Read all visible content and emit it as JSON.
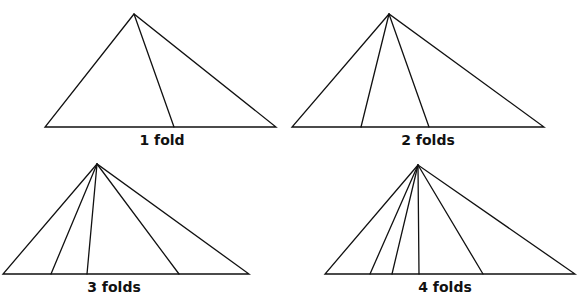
{
  "figure": {
    "panels": [
      {
        "label": "1 fold",
        "apex": [
          134,
          14
        ],
        "base_y": 127,
        "base_left": 45,
        "base_right": 276,
        "fold_xs": [
          174
        ],
        "label_pos": [
          162,
          132
        ]
      },
      {
        "label": "2 folds",
        "apex": [
          389,
          14
        ],
        "base_y": 127,
        "base_left": 292,
        "base_right": 544,
        "fold_xs": [
          361,
          429
        ],
        "label_pos": [
          428,
          132
        ]
      },
      {
        "label": "3 folds",
        "apex": [
          97,
          164
        ],
        "base_y": 274,
        "base_left": 3,
        "base_right": 249,
        "fold_xs": [
          51,
          87,
          179
        ],
        "label_pos": [
          114,
          279
        ]
      },
      {
        "label": "4 folds",
        "apex": [
          418,
          165
        ],
        "base_y": 274,
        "base_left": 325,
        "base_right": 575,
        "fold_xs": [
          370,
          392,
          419,
          483
        ],
        "label_pos": [
          445,
          279
        ]
      }
    ],
    "line_color": "#111111",
    "background": "#ffffff"
  }
}
